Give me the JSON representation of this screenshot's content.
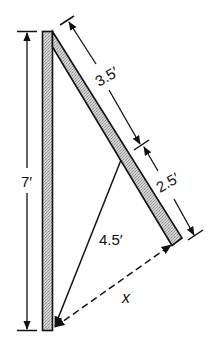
{
  "figure": {
    "type": "geometry-diagram"
  },
  "labels": {
    "post_height": "7′",
    "beam_upper_segment": "3.5′",
    "beam_lower_segment": "2.5′",
    "brace_length": "4.5′",
    "unknown_distance": "x"
  },
  "measurements": {
    "post_height_ft": 7,
    "beam_upper_segment_ft": 3.5,
    "beam_lower_segment_ft": 2.5,
    "brace_length_ft": 4.5,
    "unknown": "x"
  },
  "colors": {
    "line": "#111111",
    "fill_hatch": "#c8c8c8",
    "background": "#ffffff"
  }
}
